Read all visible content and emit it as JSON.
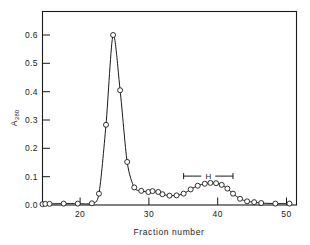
{
  "figure": {
    "background": "#ffffff",
    "ink": "#1a1a1a",
    "marker_fill": "#ffffff"
  },
  "chart_data": {
    "type": "line",
    "title": "",
    "subtitle": "",
    "xlabel": "Fraction number",
    "ylabel": "A280",
    "ylabel_base": "A",
    "ylabel_sub": "280",
    "xlim": [
      15,
      51
    ],
    "ylim": [
      0.0,
      0.65
    ],
    "grid": false,
    "legend": "none",
    "x_ticks": [
      20,
      30,
      40,
      50
    ],
    "x_tick_labels": [
      "20",
      "30",
      "40",
      "50"
    ],
    "y_ticks": [
      0.0,
      0.1,
      0.2,
      0.3,
      0.4,
      0.5,
      0.6
    ],
    "y_tick_labels": [
      "0.0",
      "0.1",
      "0.2",
      "0.3",
      "0.4",
      "0.5",
      "0.6"
    ],
    "series": [
      {
        "name": "A280 elution profile",
        "marker": "open-circle",
        "x": [
          15,
          15.4,
          16,
          18,
          20,
          22,
          23,
          24,
          25,
          26,
          27,
          28,
          29,
          30,
          30.6,
          31.4,
          32,
          33,
          34,
          35,
          36,
          37,
          38,
          38.8,
          39.6,
          40.4,
          41.2,
          42,
          43,
          44,
          45,
          46,
          48,
          50
        ],
        "y": [
          0.003,
          0.004,
          0.004,
          0.005,
          0.005,
          0.006,
          0.04,
          0.283,
          0.6,
          0.405,
          0.152,
          0.062,
          0.05,
          0.046,
          0.049,
          0.046,
          0.038,
          0.033,
          0.034,
          0.04,
          0.055,
          0.068,
          0.075,
          0.078,
          0.077,
          0.071,
          0.058,
          0.04,
          0.022,
          0.013,
          0.01,
          0.007,
          0.005,
          0.005
        ]
      }
    ],
    "annotations": [
      {
        "type": "range-bracket",
        "label": "H",
        "x_start": 35.0,
        "x_end": 42.0,
        "y": 0.102
      }
    ]
  }
}
